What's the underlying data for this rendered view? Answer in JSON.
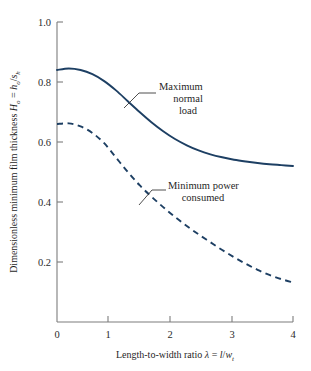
{
  "figure": {
    "background_color": "#ffffff",
    "axis_color": "#7d7d7d",
    "text_color": "#1f1f1f",
    "curve_color": "#1d3f63"
  },
  "axes": {
    "x_tick_labels": [
      "0",
      "1",
      "2",
      "3",
      "4"
    ],
    "y_tick_labels": [
      "0.2",
      "0.4",
      "0.6",
      "0.8",
      "1.0"
    ],
    "x_title_parts": {
      "lead": "Length-to-width ratio ",
      "lambda": "λ",
      "equals": " = ",
      "num": "l",
      "slash": "/",
      "den": "w",
      "den_sub": "t"
    },
    "y_title_parts": {
      "lead": "Dimensionless minimum film thickness ",
      "sym": "H",
      "sym_sub": "o",
      "equals": " = ",
      "num": "h",
      "num_sub": "o",
      "slash": "/",
      "den": "s",
      "den_sub": "h"
    }
  },
  "annotations": {
    "maximum_normal_load": {
      "line1": "Maximum",
      "line2": "normal",
      "line3": "load"
    },
    "minimum_power_consumed": {
      "line1": "Minimum power",
      "line2": "consumed"
    }
  },
  "chart_data": {
    "type": "line",
    "title": "",
    "xlabel": "Length-to-width ratio λ = l/w_t",
    "ylabel": "Dimensionless minimum film thickness H_o = h_o/s_h",
    "xlim": [
      0,
      4
    ],
    "ylim": [
      0,
      1.0
    ],
    "xticks": [
      0,
      1,
      2,
      3,
      4
    ],
    "yticks": [
      0.2,
      0.4,
      0.6,
      0.8,
      1.0
    ],
    "grid": false,
    "legend": "none (curves labeled by annotation callouts)",
    "series": [
      {
        "name": "Maximum normal load",
        "style": "solid",
        "color": "#1d3f63",
        "x": [
          0.0,
          0.2,
          0.4,
          0.6,
          0.8,
          1.0,
          1.2,
          1.4,
          1.6,
          1.8,
          2.0,
          2.2,
          2.4,
          2.6,
          2.8,
          3.0,
          3.2,
          3.4,
          3.6,
          3.8,
          4.0
        ],
        "y": [
          0.84,
          0.845,
          0.84,
          0.826,
          0.803,
          0.772,
          0.736,
          0.7,
          0.666,
          0.636,
          0.61,
          0.589,
          0.572,
          0.559,
          0.549,
          0.541,
          0.535,
          0.53,
          0.526,
          0.523,
          0.52
        ]
      },
      {
        "name": "Minimum power consumed",
        "style": "dashed",
        "color": "#1d3f63",
        "x": [
          0.0,
          0.2,
          0.4,
          0.6,
          0.8,
          1.0,
          1.2,
          1.4,
          1.6,
          1.8,
          2.0,
          2.2,
          2.4,
          2.6,
          2.8,
          3.0,
          3.2,
          3.4,
          3.6,
          3.8,
          4.0
        ],
        "y": [
          0.66,
          0.662,
          0.652,
          0.63,
          0.596,
          0.548,
          0.5,
          0.456,
          0.418,
          0.383,
          0.35,
          0.32,
          0.292,
          0.266,
          0.24,
          0.216,
          0.194,
          0.174,
          0.157,
          0.143,
          0.132
        ]
      }
    ]
  }
}
